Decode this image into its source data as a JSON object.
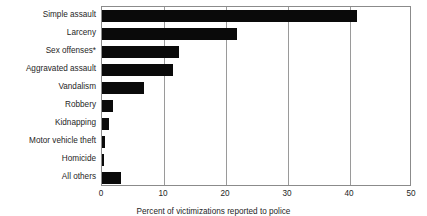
{
  "chart_data": {
    "type": "bar",
    "orientation": "horizontal",
    "title": "",
    "subtitle": "",
    "xlabel": "Percent of victimizations reported to police",
    "ylabel": "",
    "categories": [
      "Simple assault",
      "Larceny",
      "Sex offenses*",
      "Aggravated assault",
      "Vandalism",
      "Robbery",
      "Kidnapping",
      "Motor vehicle theft",
      "Homicide",
      "All others"
    ],
    "values": [
      41.2,
      21.8,
      12.4,
      11.4,
      6.8,
      1.8,
      1.1,
      0.5,
      0.3,
      3.0
    ],
    "xlim": [
      0,
      50
    ],
    "xticks": [
      0,
      10,
      20,
      30,
      40,
      50
    ],
    "xtick_labels": [
      "0",
      "10",
      "20",
      "30",
      "40",
      "50"
    ],
    "grid": "vertical",
    "legend": "none",
    "bar_color": "#0a0a0a",
    "axis_color": "#8b8b8b",
    "gridline_color": "#9a9a9a",
    "background_color": "#ffffff",
    "footnote_marker": "*"
  }
}
